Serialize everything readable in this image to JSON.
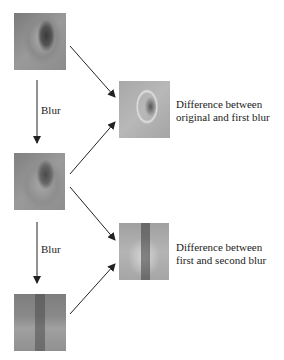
{
  "diagram": {
    "nodes": [
      {
        "id": "original",
        "desc": "original ear image"
      },
      {
        "id": "first_blur",
        "desc": "first blurred ear image"
      },
      {
        "id": "second_blur",
        "desc": "second blurred ear image"
      },
      {
        "id": "diff1",
        "desc": "difference image 1"
      },
      {
        "id": "diff2",
        "desc": "difference image 2"
      }
    ],
    "edges": [
      {
        "from": "original",
        "to": "first_blur",
        "label": "Blur"
      },
      {
        "from": "first_blur",
        "to": "second_blur",
        "label": "Blur"
      },
      {
        "from": "original",
        "to": "diff1"
      },
      {
        "from": "first_blur",
        "to": "diff1"
      },
      {
        "from": "first_blur",
        "to": "diff2"
      },
      {
        "from": "second_blur",
        "to": "diff2"
      }
    ]
  },
  "labels": {
    "blur1": "Blur",
    "blur2": "Blur",
    "diff1_line1": "Difference between",
    "diff1_line2": "original and first blur",
    "diff2_line1": "Difference between",
    "diff2_line2": "first and second blur"
  }
}
